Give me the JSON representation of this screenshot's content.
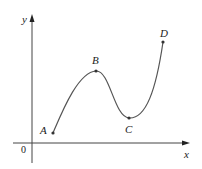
{
  "figure": {
    "axes": {
      "x_label": "x",
      "y_label": "y",
      "origin_label": "0",
      "axis_color": "#444444"
    },
    "curve": {
      "color": "#555555",
      "description": "Smooth curve rising from A to local maximum B, falling to local minimum C, then rising steeply to D"
    },
    "points": [
      {
        "label": "A",
        "role": "start point"
      },
      {
        "label": "B",
        "role": "local maximum"
      },
      {
        "label": "C",
        "role": "local minimum"
      },
      {
        "label": "D",
        "role": "end point"
      }
    ]
  }
}
